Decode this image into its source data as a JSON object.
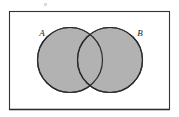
{
  "figure": {
    "type": "venn-diagram",
    "caption": "",
    "background_color": "#ffffff",
    "universal_set_box": {
      "name": "universal-set-rectangle",
      "x": 9,
      "y": 11,
      "width": 161,
      "height": 99,
      "stroke_color": "#333333",
      "fill_color": "#ffffff",
      "stroke_width": 1.1,
      "bottom_edge_emphasis": true
    },
    "sets": [
      {
        "id": "A",
        "label": "A",
        "label_x": 42,
        "label_y": 36,
        "center_x": 70,
        "center_y": 60,
        "radius": 33,
        "fill_color": "#b2b2b2",
        "stroke_color": "#2b2b2b",
        "shaded": true
      },
      {
        "id": "B",
        "label": "B",
        "label_x": 140,
        "label_y": 36,
        "center_x": 110,
        "center_y": 60,
        "radius": 33,
        "fill_color": "#b2b2b2",
        "stroke_color": "#2b2b2b",
        "shaded": true
      }
    ],
    "intersection": {
      "name": "intersection-lens-region",
      "shaded": true,
      "fill_color": "#b2b2b2"
    },
    "artifacts": [
      {
        "name": "scan-speck",
        "x": 44,
        "y": 3,
        "width": 3,
        "height": 3,
        "color": "#cfcfcf"
      }
    ],
    "colors": {
      "shading": "#b2b2b2",
      "outline": "#2b2b2b",
      "frame": "#333333",
      "label": "#1a1a1a",
      "background": "#ffffff"
    }
  }
}
